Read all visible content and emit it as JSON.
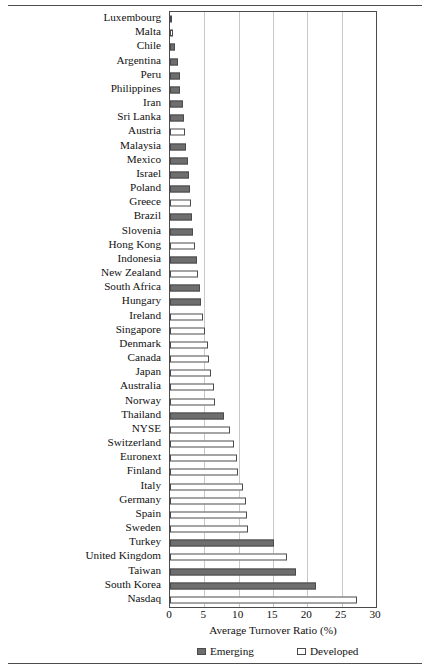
{
  "chart_data": {
    "type": "bar",
    "orientation": "horizontal",
    "title": "",
    "xlabel": "Average Turnover Ratio (%)",
    "ylabel": "",
    "xlim": [
      0,
      30
    ],
    "xticks": [
      0,
      5,
      10,
      15,
      20,
      25,
      30
    ],
    "grid": true,
    "grid_axis": "x",
    "legend_position": "bottom",
    "legend": [
      {
        "name": "Emerging",
        "color": "#6e6e6e"
      },
      {
        "name": "Developed",
        "color": "#ffffff"
      }
    ],
    "categories": [
      "Luxembourg",
      "Malta",
      "Chile",
      "Argentina",
      "Peru",
      "Philippines",
      "Iran",
      "Sri Lanka",
      "Austria",
      "Malaysia",
      "Mexico",
      "Israel",
      "Poland",
      "Greece",
      "Brazil",
      "Slovenia",
      "Hong Kong",
      "Indonesia",
      "New Zealand",
      "South Africa",
      "Hungary",
      "Ireland",
      "Singapore",
      "Denmark",
      "Canada",
      "Japan",
      "Australia",
      "Norway",
      "Thailand",
      "NYSE",
      "Switzerland",
      "Euronext",
      "Finland",
      "Italy",
      "Germany",
      "Spain",
      "Sweden",
      "Turkey",
      "United Kingdom",
      "Taiwan",
      "South Korea",
      "Nasdaq"
    ],
    "values": [
      0.3,
      0.4,
      0.8,
      1.1,
      1.4,
      1.5,
      1.9,
      2.1,
      2.2,
      2.4,
      2.6,
      2.7,
      2.9,
      3.1,
      3.2,
      3.4,
      3.7,
      4.0,
      4.1,
      4.4,
      4.5,
      4.8,
      5.1,
      5.5,
      5.7,
      6.0,
      6.4,
      6.6,
      7.9,
      8.7,
      9.3,
      9.7,
      9.9,
      10.6,
      11.0,
      11.2,
      11.3,
      15.2,
      17.0,
      18.3,
      21.3,
      27.3
    ],
    "groups": [
      "Developed",
      "Developed",
      "Emerging",
      "Emerging",
      "Emerging",
      "Emerging",
      "Emerging",
      "Emerging",
      "Developed",
      "Emerging",
      "Emerging",
      "Emerging",
      "Emerging",
      "Developed",
      "Emerging",
      "Emerging",
      "Developed",
      "Emerging",
      "Developed",
      "Emerging",
      "Emerging",
      "Developed",
      "Developed",
      "Developed",
      "Developed",
      "Developed",
      "Developed",
      "Developed",
      "Emerging",
      "Developed",
      "Developed",
      "Developed",
      "Developed",
      "Developed",
      "Developed",
      "Developed",
      "Developed",
      "Emerging",
      "Developed",
      "Emerging",
      "Emerging",
      "Developed"
    ]
  }
}
